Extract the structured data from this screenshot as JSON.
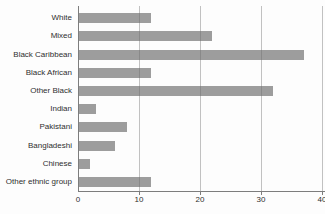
{
  "chart_data": {
    "type": "bar",
    "orientation": "horizontal",
    "categories": [
      "White",
      "Mixed",
      "Black Caribbean",
      "Black African",
      "Other Black",
      "Indian",
      "Pakistani",
      "Bangladeshi",
      "Chinese",
      "Other ethnic group"
    ],
    "values": [
      12,
      22,
      37,
      12,
      32,
      3,
      8,
      6,
      2,
      12
    ],
    "xlim": [
      0,
      40
    ],
    "xticks": [
      0,
      10,
      20,
      30,
      40
    ],
    "grid": true,
    "legend": "none",
    "colors": {
      "bar": "#9d9d9d",
      "gridline": "#6e6e6e",
      "axis": "#7d7d7d",
      "label": "#2f2f2f",
      "background": "#fdfdfd"
    }
  }
}
